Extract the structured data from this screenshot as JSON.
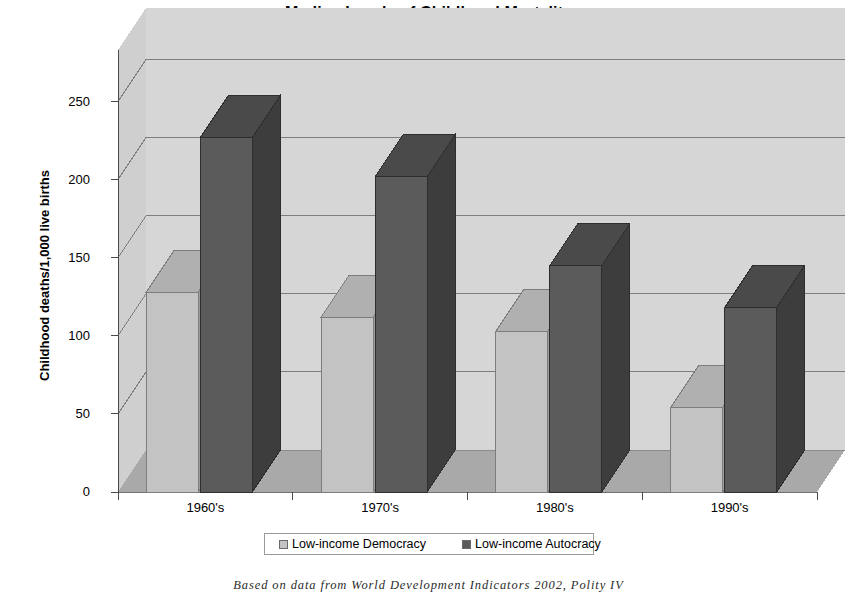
{
  "chart_data": {
    "type": "bar",
    "title": "Median Levels of Childhood Mortality",
    "xlabel": "",
    "ylabel": "Childhood deaths/1,000 live births",
    "categories": [
      "1960's",
      "1970's",
      "1980's",
      "1990's"
    ],
    "ylim": [
      0,
      283
    ],
    "yticks": [
      0,
      50,
      100,
      150,
      200,
      250
    ],
    "ytick_labels": [
      "0",
      "50",
      "100",
      "150",
      "200",
      "250"
    ],
    "grid": true,
    "legend_position": "bottom",
    "style": "3d-column",
    "series": [
      {
        "name": "Low-income Democracy",
        "color": "#c3c3c3",
        "values": [
          128,
          112,
          103,
          54
        ]
      },
      {
        "name": "Low-income Autocracy",
        "color": "#5b5b5b",
        "values": [
          227,
          202,
          145,
          118
        ]
      }
    ]
  },
  "caption": {
    "text": "Based on data from World Development Indicators 2002, Polity IV"
  },
  "colors": {
    "wall": "#d6d6d6",
    "floor": "#a9a9a9",
    "gridline": "#6f6f6f",
    "axis": "#4a4a4a",
    "series_light": "#c3c3c3",
    "series_light_top": "#b0b0b0",
    "series_light_side": "#9d9d9d",
    "series_dark": "#5b5b5b",
    "series_dark_top": "#4a4a4a",
    "series_dark_side": "#3d3d3d"
  }
}
